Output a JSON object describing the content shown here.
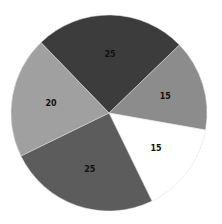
{
  "chart_data": {
    "type": "pie",
    "title": "",
    "categories": [
      "A",
      "B",
      "C",
      "D",
      "E"
    ],
    "values": [
      25,
      15,
      15,
      25,
      20
    ],
    "labels": [
      "25",
      "15",
      "15",
      "25",
      "20"
    ],
    "colors": [
      "#3c3c3c",
      "#8c8c8c",
      "#ffffff",
      "#5c5c5c",
      "#a0a0a0"
    ],
    "start_angle_deg": -44,
    "direction": "clockwise",
    "legend": "none"
  }
}
